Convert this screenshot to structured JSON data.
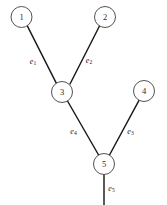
{
  "diagram": {
    "type": "node-link-graph",
    "background_color": "#ffffff",
    "line_color": "#1a1a1a",
    "node_fill_color": "#ffffff",
    "node_stroke_color": "#4a4a4a",
    "label_color": "#1a1a1a",
    "canvas": {
      "width": 167,
      "height": 205
    },
    "nodes": [
      {
        "id": "1",
        "label": "1",
        "cx": 21.5,
        "cy": 17.0,
        "r": 10.5
      },
      {
        "id": "2",
        "label": "2",
        "cx": 105.0,
        "cy": 17.0,
        "r": 10.5
      },
      {
        "id": "3",
        "label": "3",
        "cx": 62.0,
        "cy": 92.0,
        "r": 10.5
      },
      {
        "id": "4",
        "label": "4",
        "cx": 144.0,
        "cy": 91.0,
        "r": 10.5
      },
      {
        "id": "5",
        "label": "5",
        "cx": 104.0,
        "cy": 164.0,
        "r": 10.5
      }
    ],
    "edges": [
      {
        "id": "e1",
        "label_base": "e",
        "label_sub": "1",
        "from": "1",
        "to": "3",
        "x1": 27.3,
        "y1": 25.8,
        "x2": 56.4,
        "y2": 83.3,
        "label_x": 33.0,
        "label_y": 60.5
      },
      {
        "id": "e2",
        "label_base": "e",
        "label_sub": "2",
        "from": "2",
        "to": "3",
        "x1": 99.5,
        "y1": 26.0,
        "x2": 70.0,
        "y2": 84.0,
        "label_x": 89.0,
        "label_y": 60.0
      },
      {
        "id": "e3",
        "label_base": "e",
        "label_sub": "3",
        "from": "4",
        "to": "5",
        "x1": 139.0,
        "y1": 100.3,
        "x2": 109.5,
        "y2": 155.0,
        "label_x": 130.5,
        "label_y": 131.0
      },
      {
        "id": "e4",
        "label_base": "e",
        "label_sub": "4",
        "from": "3",
        "to": "5",
        "x1": 67.5,
        "y1": 101.0,
        "x2": 98.6,
        "y2": 155.0,
        "label_x": 73.5,
        "label_y": 131.0
      },
      {
        "id": "e5",
        "label_base": "e",
        "label_sub": "5",
        "from": "5",
        "to": null,
        "x1": 104.0,
        "y1": 174.5,
        "x2": 104.0,
        "y2": 205.0,
        "label_x": 111.5,
        "label_y": 188.0
      }
    ]
  }
}
